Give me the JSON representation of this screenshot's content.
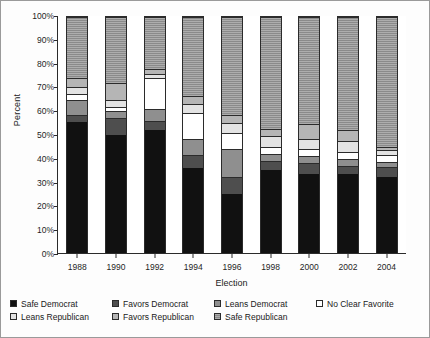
{
  "chart_data": {
    "type": "bar",
    "subtype": "stacked-percentage",
    "title": "",
    "xlabel": "Election",
    "ylabel": "Percent",
    "categories": [
      "1988",
      "1990",
      "1992",
      "1994",
      "1996",
      "1998",
      "2000",
      "2002",
      "2004"
    ],
    "ylim": [
      0,
      100
    ],
    "ytick_labels": [
      "0%",
      "10%",
      "20%",
      "30%",
      "40%",
      "50%",
      "60%",
      "70%",
      "80%",
      "90%",
      "100%"
    ],
    "ytick_values": [
      0,
      10,
      20,
      30,
      40,
      50,
      60,
      70,
      80,
      90,
      100
    ],
    "grid": false,
    "legend_position": "bottom",
    "stack_order": "bottom-to-top",
    "series": [
      {
        "name": "Safe Democrat",
        "color": "#111111",
        "values": [
          55.5,
          50.0,
          52.0,
          36.0,
          25.0,
          35.0,
          33.5,
          33.5,
          32.0
        ]
      },
      {
        "name": "Favors Democrat",
        "color": "#4e4e4e",
        "values": [
          3.0,
          7.0,
          4.0,
          5.5,
          7.0,
          4.0,
          4.5,
          3.5,
          4.5
        ]
      },
      {
        "name": "Leans Democrat",
        "color": "#8f8f8f",
        "values": [
          6.5,
          3.0,
          5.0,
          7.0,
          12.0,
          3.0,
          3.0,
          3.0,
          2.0
        ]
      },
      {
        "name": "No Clear Favorite",
        "color": "#ffffff",
        "values": [
          2.5,
          2.0,
          13.0,
          11.0,
          7.0,
          3.0,
          3.0,
          3.0,
          3.0
        ]
      },
      {
        "name": "Leans Republican",
        "color": "#e3e3e3",
        "values": [
          3.0,
          3.0,
          2.0,
          3.5,
          4.0,
          4.5,
          4.5,
          4.5,
          2.0
        ]
      },
      {
        "name": "Favors Republican",
        "color": "#b5b5b5",
        "values": [
          3.5,
          7.0,
          2.0,
          3.5,
          3.5,
          3.0,
          6.0,
          4.5,
          1.5
        ]
      },
      {
        "name": "Safe Republican",
        "color": "#8a8a8a",
        "values": [
          26.0,
          28.0,
          22.0,
          33.5,
          41.5,
          47.5,
          45.5,
          48.0,
          55.0
        ]
      }
    ]
  },
  "legend": {
    "items": [
      {
        "label": "Safe Democrat"
      },
      {
        "label": "Favors Democrat"
      },
      {
        "label": "Leans Democrat"
      },
      {
        "label": "No Clear Favorite"
      },
      {
        "label": "Leans Republican"
      },
      {
        "label": "Favors Republican"
      },
      {
        "label": "Safe Republican"
      }
    ]
  }
}
